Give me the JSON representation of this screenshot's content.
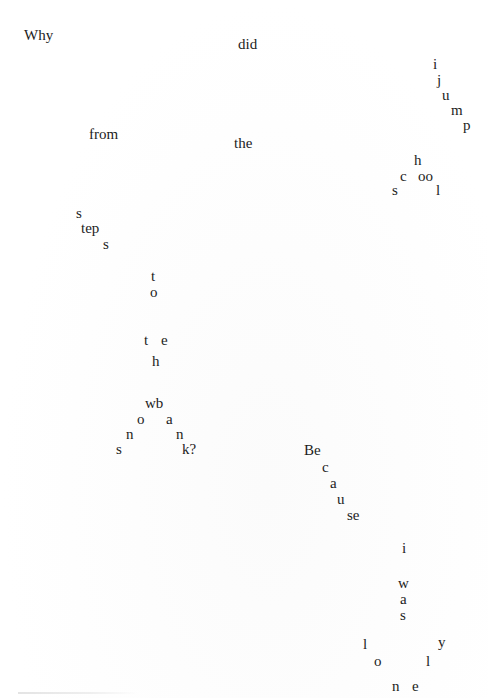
{
  "poem": {
    "line1": {
      "why": "Why",
      "did": "did"
    },
    "jump": [
      "i",
      "j",
      "u",
      "m",
      "p"
    ],
    "line2": {
      "from": "from",
      "the": "the"
    },
    "school": {
      "h": "h",
      "c": "c",
      "oo": "oo",
      "s": "s",
      "l": "l"
    },
    "steps": {
      "s1": "s",
      "tep": "tep",
      "s2": "s"
    },
    "to": [
      "t",
      "o"
    ],
    "the2": {
      "t": "t",
      "e": "e",
      "h": "h"
    },
    "swan": {
      "wb": "wb",
      "o": "o",
      "a": "a",
      "n1": "n",
      "n2": "n",
      "s": "s",
      "k": "k?"
    },
    "because": [
      "Be",
      "c",
      "a",
      "u",
      "se"
    ],
    "i": "i",
    "was": [
      "w",
      "a",
      "s"
    ],
    "lonely": {
      "l1": "l",
      "o": "o",
      "l2": "l",
      "y": "y",
      "n": "n",
      "e": "e"
    }
  }
}
